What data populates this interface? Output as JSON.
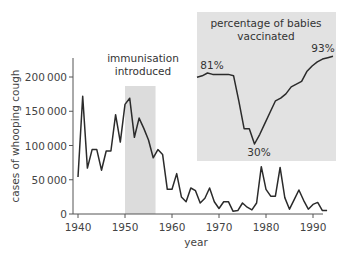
{
  "chart_data": [
    {
      "type": "line",
      "title": "",
      "xlabel": "year",
      "ylabel": "cases of whooping cough",
      "xlim": [
        1940,
        1993
      ],
      "ylim": [
        0,
        225000
      ],
      "xticks": [
        1940,
        1950,
        1960,
        1970,
        1980,
        1990
      ],
      "yticks": [
        0,
        50000,
        100000,
        150000,
        200000
      ],
      "ytick_labels": [
        "0",
        "50000",
        "100000",
        "150000",
        "200000"
      ],
      "grid": false,
      "legend": null,
      "annotations": [
        {
          "text": "immunisation introduced",
          "span": [
            1950,
            1956.5
          ],
          "shaded": true
        }
      ],
      "series": [
        {
          "name": "cases of whooping cough",
          "x": [
            1940,
            1941,
            1942,
            1943,
            1944,
            1945,
            1946,
            1947,
            1948,
            1949,
            1950,
            1951,
            1952,
            1953,
            1954,
            1955,
            1956,
            1957,
            1958,
            1959,
            1960,
            1961,
            1962,
            1963,
            1964,
            1965,
            1966,
            1967,
            1968,
            1969,
            1970,
            1971,
            1972,
            1973,
            1974,
            1975,
            1976,
            1977,
            1978,
            1979,
            1980,
            1981,
            1982,
            1983,
            1984,
            1985,
            1986,
            1987,
            1988,
            1989,
            1990,
            1991,
            1992,
            1993
          ],
          "values": [
            54000,
            172000,
            67000,
            94000,
            94000,
            64000,
            92000,
            92000,
            145000,
            105000,
            160000,
            169000,
            112000,
            140000,
            125000,
            108000,
            82000,
            94000,
            87000,
            36000,
            36000,
            59000,
            25000,
            18000,
            38000,
            34000,
            16000,
            23000,
            38000,
            18000,
            8000,
            18000,
            18000,
            4000,
            5000,
            16000,
            10000,
            6000,
            16000,
            69000,
            36000,
            26000,
            26000,
            68000,
            24000,
            7000,
            21000,
            35000,
            20000,
            7000,
            14000,
            17000,
            5000,
            5000
          ]
        }
      ]
    },
    {
      "type": "line",
      "title": "percentage of babies vaccinated",
      "xlabel": "year",
      "ylabel": "percentage",
      "xlim": [
        1967,
        1993
      ],
      "grid": false,
      "annotations": [
        {
          "text": "81%",
          "x": 1969,
          "y": 81
        },
        {
          "text": "30%",
          "x": 1978,
          "y": 30
        },
        {
          "text": "93%",
          "x": 1993,
          "y": 93
        }
      ],
      "series": [
        {
          "name": "percentage of babies vaccinated",
          "x": [
            1967,
            1968,
            1969,
            1970,
            1971,
            1972,
            1973,
            1974,
            1975,
            1976,
            1977,
            1978,
            1979,
            1980,
            1981,
            1982,
            1983,
            1984,
            1985,
            1986,
            1987,
            1988,
            1989,
            1990,
            1991,
            1992,
            1993
          ],
          "values": [
            78,
            79,
            81,
            80,
            80,
            80,
            80,
            79,
            61,
            41,
            41,
            30,
            37,
            45,
            53,
            61,
            63,
            66,
            71,
            73,
            75,
            82,
            86,
            89,
            91,
            92,
            93
          ]
        }
      ]
    }
  ],
  "labels": {
    "ylabel": "cases of whooping cough",
    "xlabel": "year",
    "immunisation_line1": "immunisation",
    "immunisation_line2": "introduced",
    "inset_title_line1": "percentage of babies",
    "inset_title_line2": "vaccinated",
    "pct_start": "81%",
    "pct_min": "30%",
    "pct_end": "93%"
  },
  "colors": {
    "line": "#2b2b2b",
    "shade": "#dcdcdc",
    "inset_bg": "#e2e2e2",
    "axis": "#555555"
  }
}
